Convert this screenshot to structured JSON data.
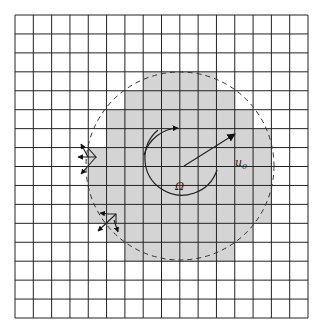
{
  "figure": {
    "labels": {
      "center": "Ω",
      "radius": "u",
      "radius_sub": "0"
    },
    "grid": {
      "cols": 16,
      "rows": 16,
      "x0": 15,
      "y0": 15,
      "x1": 308,
      "y1": 318
    },
    "shaded_rows": [
      {
        "row": 3,
        "from": 7,
        "to": 10
      },
      {
        "row": 4,
        "from": 6,
        "to": 11
      },
      {
        "row": 5,
        "from": 5,
        "to": 12
      },
      {
        "row": 6,
        "from": 5,
        "to": 13
      },
      {
        "row": 7,
        "from": 4,
        "to": 13
      },
      {
        "row": 8,
        "from": 4,
        "to": 13
      },
      {
        "row": 9,
        "from": 4,
        "to": 13
      },
      {
        "row": 10,
        "from": 4,
        "to": 13
      },
      {
        "row": 11,
        "from": 5,
        "to": 12
      },
      {
        "row": 12,
        "from": 6,
        "to": 11
      }
    ],
    "circle": {
      "cx": 180,
      "cy": 166,
      "r": 94
    },
    "colors": {
      "shade": "#d4d4d4",
      "line": "#222222"
    }
  }
}
